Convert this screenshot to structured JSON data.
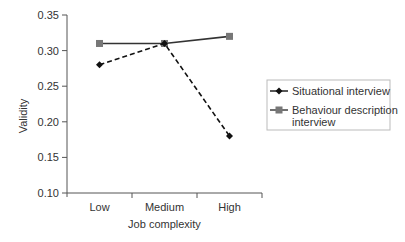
{
  "chart_data": {
    "type": "line",
    "title": "",
    "xlabel": "Job complexity",
    "ylabel": "Validity",
    "categories": [
      "Low",
      "Medium",
      "High"
    ],
    "ylim": [
      0.1,
      0.35
    ],
    "yticks": [
      "0.10",
      "0.15",
      "0.20",
      "0.25",
      "0.30",
      "0.35"
    ],
    "grid": false,
    "legend_position": "right",
    "series": [
      {
        "name": "Situational interview",
        "values": [
          0.28,
          0.31,
          0.18
        ],
        "line_style": "dashed",
        "marker": "diamond",
        "color": "#111111"
      },
      {
        "name": "Behaviour description interview",
        "values": [
          0.31,
          0.31,
          0.32
        ],
        "line_style": "solid",
        "marker": "square",
        "color": "#333333",
        "marker_color": "#777777"
      }
    ]
  }
}
